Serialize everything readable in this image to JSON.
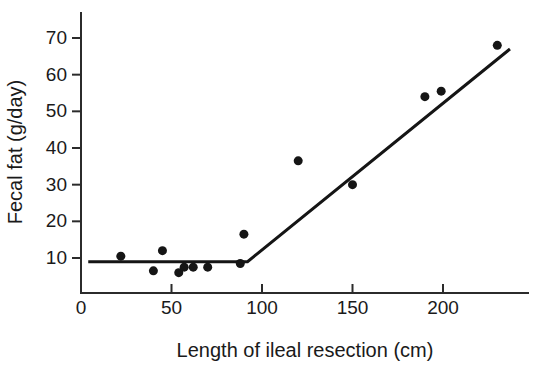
{
  "chart_data": {
    "type": "scatter",
    "title": "",
    "xlabel": "Length of ileal resection (cm)",
    "ylabel": "Fecal fat (g/day)",
    "xlim": [
      0,
      250
    ],
    "ylim": [
      0,
      75
    ],
    "xticks": [
      0,
      50,
      100,
      150,
      200
    ],
    "yticks": [
      10,
      20,
      30,
      40,
      50,
      60,
      70
    ],
    "xtick_labels": [
      "0",
      "50",
      "100",
      "150",
      "200"
    ],
    "ytick_labels": [
      "10",
      "20",
      "30",
      "40",
      "50",
      "60",
      "70"
    ],
    "grid": false,
    "legend": null,
    "x": [
      22,
      40,
      45,
      54,
      57,
      62,
      70,
      88,
      90,
      120,
      150,
      190,
      199,
      230
    ],
    "y": [
      10.5,
      6.5,
      12.0,
      6.0,
      7.5,
      7.5,
      7.5,
      8.5,
      16.5,
      36.5,
      30.0,
      54.0,
      55.5,
      68.0
    ],
    "points": [
      {
        "x": 22,
        "y": 10.5
      },
      {
        "x": 40,
        "y": 6.5
      },
      {
        "x": 45,
        "y": 12.0
      },
      {
        "x": 54,
        "y": 6.0
      },
      {
        "x": 57,
        "y": 7.5
      },
      {
        "x": 62,
        "y": 7.5
      },
      {
        "x": 70,
        "y": 7.5
      },
      {
        "x": 88,
        "y": 8.5
      },
      {
        "x": 90,
        "y": 16.5
      },
      {
        "x": 120,
        "y": 36.5
      },
      {
        "x": 150,
        "y": 30.0
      },
      {
        "x": 190,
        "y": 54.0
      },
      {
        "x": 199,
        "y": 55.5
      },
      {
        "x": 230,
        "y": 68.0
      }
    ],
    "series": [
      {
        "name": "fitted-piecewise-line",
        "type": "line",
        "points": [
          {
            "x": 4,
            "y": 9.0
          },
          {
            "x": 92,
            "y": 9.0
          },
          {
            "x": 237,
            "y": 67.0
          }
        ]
      }
    ],
    "marker": {
      "shape": "circle",
      "color": "#151515",
      "size_px": 9
    },
    "line_color": "#151515",
    "axis_color": "#2b2b2b",
    "background": "#ffffff"
  }
}
